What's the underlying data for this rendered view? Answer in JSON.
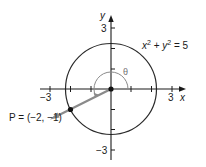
{
  "diagram": {
    "type": "unit-circle-angle",
    "equation": {
      "x_part": "x",
      "y_part": "y",
      "exp": "2",
      "plus": "+",
      "rhs": "= 5"
    },
    "axes": {
      "x_label": "x",
      "y_label": "y",
      "x_ticks": {
        "min_label": "−3",
        "max_label": "3"
      },
      "y_ticks": {
        "max_label": "3",
        "min_label": "−3"
      },
      "range": [
        -3,
        3
      ]
    },
    "circle": {
      "radius_squared": 5,
      "center": [
        0,
        0
      ]
    },
    "point": {
      "name": "P",
      "x": -2,
      "y": -1,
      "label": "P = (−2, −1)"
    },
    "angle": {
      "symbol": "θ"
    },
    "colors": {
      "axis": "#1a1a1a",
      "circle": "#2a2a2a",
      "ray": "#8a8a8a",
      "arc": "#8a8a8a",
      "point": "#111111"
    }
  }
}
